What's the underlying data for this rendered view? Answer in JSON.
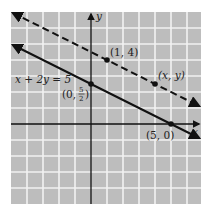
{
  "figure": {
    "type": "coordinate-graph",
    "background_color": "#bdbdbd",
    "grid_color": "#f2f2f2",
    "axes": {
      "x_label": "x",
      "y_label": "y",
      "x_range": [
        -5,
        7
      ],
      "y_range": [
        -5,
        7
      ],
      "unit_px": 16,
      "origin_px": [
        91,
        124
      ]
    },
    "lines": [
      {
        "name": "solid-line",
        "equation_label": "x + 2y = 5",
        "style": "solid",
        "slope": -0.5,
        "intercept": 2.5,
        "x_range": [
          -5,
          7
        ]
      },
      {
        "name": "dashed-line",
        "style": "dashed",
        "slope": -0.5,
        "intercept": 4.5,
        "x_range": [
          -5,
          7
        ]
      }
    ],
    "points": [
      {
        "name": "point-0-5-2",
        "coords": [
          0,
          2.5
        ],
        "label": "(0, 5/2)",
        "label_parts": {
          "open": "(0, ",
          "num": "5",
          "den": "2",
          "close": ")"
        }
      },
      {
        "name": "point-5-0",
        "coords": [
          5,
          0
        ],
        "label": "(5, 0)"
      },
      {
        "name": "point-1-4",
        "coords": [
          1,
          4
        ],
        "label": "(1, 4)"
      },
      {
        "name": "point-x-y",
        "coords": [
          4,
          2.5
        ],
        "label": "(x, y)"
      }
    ]
  }
}
